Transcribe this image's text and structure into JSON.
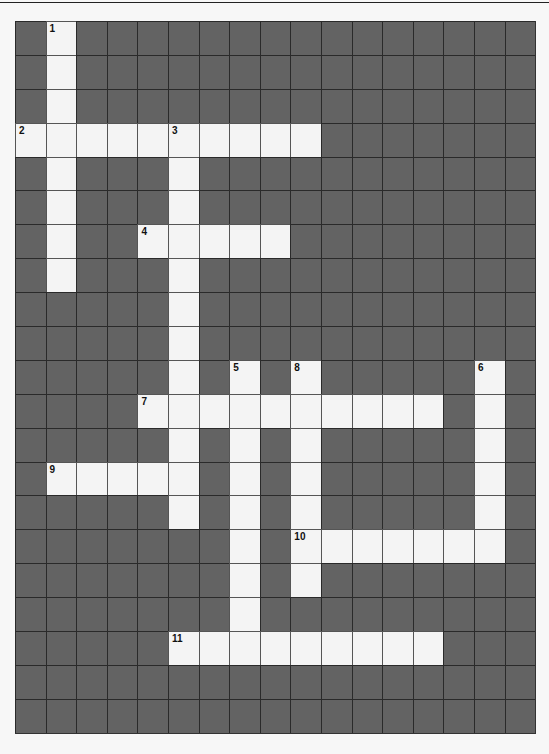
{
  "puzzle": {
    "cols": 17,
    "rows": 21,
    "colors": {
      "block": "#636363",
      "open": "#f4f4f4",
      "line": "#2a2a2a"
    },
    "entries": [
      {
        "number": "1",
        "direction": "down",
        "row": 0,
        "col": 1,
        "length": 8
      },
      {
        "number": "2",
        "direction": "across",
        "row": 3,
        "col": 0,
        "length": 10
      },
      {
        "number": "3",
        "direction": "down",
        "row": 3,
        "col": 5,
        "length": 12
      },
      {
        "number": "4",
        "direction": "across",
        "row": 6,
        "col": 4,
        "length": 5
      },
      {
        "number": "5",
        "direction": "down",
        "row": 10,
        "col": 7,
        "length": 9
      },
      {
        "number": "6",
        "direction": "down",
        "row": 10,
        "col": 15,
        "length": 6
      },
      {
        "number": "7",
        "direction": "across",
        "row": 11,
        "col": 4,
        "length": 10
      },
      {
        "number": "8",
        "direction": "down",
        "row": 10,
        "col": 9,
        "length": 7
      },
      {
        "number": "9",
        "direction": "across",
        "row": 13,
        "col": 1,
        "length": 5
      },
      {
        "number": "10",
        "direction": "across",
        "row": 15,
        "col": 9,
        "length": 7
      },
      {
        "number": "11",
        "direction": "across",
        "row": 18,
        "col": 5,
        "length": 9
      }
    ]
  }
}
